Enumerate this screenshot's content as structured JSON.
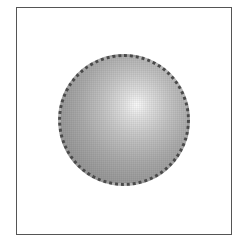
{
  "figure": {
    "frame": {
      "shape": "rectangle",
      "border_color": "#555555",
      "background_color": "#ffffff"
    },
    "sphere": {
      "shape": "circle",
      "shading": "radial-gradient",
      "highlight_color": "#fafafa",
      "shadow_color": "#8a8a8a",
      "outline_style": "dotted",
      "outline_color": "#4a4a4a"
    }
  }
}
